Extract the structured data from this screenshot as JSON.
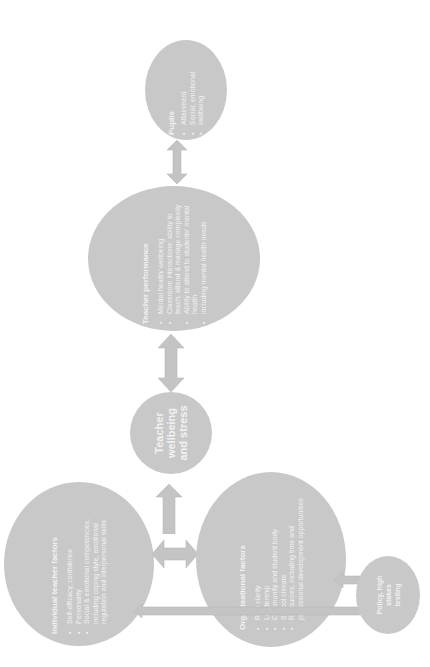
{
  "nodes": {
    "pupils": {
      "title": "Pupils",
      "items": [
        "Attainment",
        "Social, emotional",
        "wellbeing"
      ]
    },
    "teacher_performance": {
      "title": "Teacher performance",
      "items": [
        "Mental health/ wellbeing",
        "Classroom interactions: ability to teach, attend & manage complexity",
        "Ability to attend to students' mental health",
        "including mental health needs"
      ]
    },
    "wellbeing": {
      "title_line1": "Teacher",
      "title_line2": "wellbeing",
      "title_line3": "and stress"
    },
    "individual": {
      "title": "Individual teacher factors",
      "items": [
        "Self-efficacy, confidence",
        "Personality",
        "Social & emotional competencies, including coping style, emotional regulation and interpersonal skills"
      ]
    },
    "organisational": {
      "title": "Organisational factors",
      "items": [
        "Role clarity",
        "Leadership",
        "Community and student body",
        "School climate",
        "Resources, including time and professional development opportunities"
      ]
    },
    "policy": {
      "title_line1": "Policy, high",
      "title_line2": "stakes",
      "title_line3": "testing"
    }
  },
  "colors": {
    "node_fill": "#c8c8c8",
    "arrow_fill": "#c4c4c4",
    "text": "#f2f2f2",
    "background": "#ffffff"
  }
}
